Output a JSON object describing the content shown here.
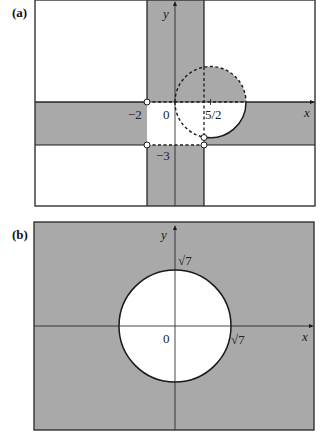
{
  "colors": {
    "shade": "#a9a9a9",
    "background": "#ffffff",
    "line": "#1a1a1a"
  },
  "panel_a": {
    "label": "(a)",
    "axis_x_label": "x",
    "axis_y_label": "y",
    "tick_labels": {
      "origin": "0",
      "x_neg2": "−2",
      "x_5_2": "5/2",
      "y_neg3": "−3"
    },
    "description": "Shaded strips -2 < x < 0... union; circle centered at (5/2,0) partially dashed, open points at (-2,0), (-2,-3), (0,-3) region corners"
  },
  "panel_b": {
    "label": "(b)",
    "axis_x_label": "x",
    "axis_y_label": "y",
    "tick_labels": {
      "origin": "0",
      "x_sqrt7": "√7",
      "y_sqrt7": "√7"
    },
    "description": "Plane shaded outside circle of radius √7 centered at origin"
  }
}
